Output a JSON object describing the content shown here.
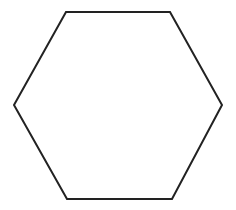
{
  "diagram": {
    "shape": "hexagon",
    "orientation": "flat-top",
    "background_color": "#ffffff",
    "stroke_color": "#222222",
    "fill_color": "none",
    "stroke_width": 2,
    "vertices": [
      [
        66,
        12
      ],
      [
        170,
        12
      ],
      [
        222,
        105
      ],
      [
        172,
        199
      ],
      [
        67,
        199
      ],
      [
        14,
        105
      ]
    ]
  }
}
